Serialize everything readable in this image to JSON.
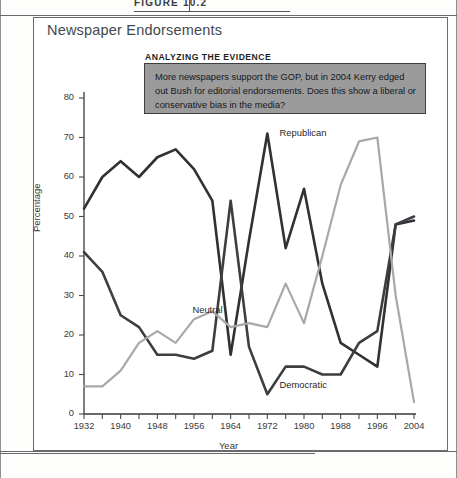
{
  "figure": {
    "number_label": "FIGURE 10.2",
    "title": "Newspaper Endorsements"
  },
  "callout": {
    "heading": "ANALYZING THE EVIDENCE",
    "body": "More newspapers support the GOP, but in 2004 Kerry edged out Bush for editorial endorsements. Does this show a liberal or conservative bias in the media?",
    "background_color": "#9b9b9b",
    "border_color": "#3f3f3f"
  },
  "chart_data": {
    "type": "line",
    "title": "Newspaper Endorsements",
    "xlabel": "Year",
    "ylabel": "Percentage",
    "ylim": [
      0,
      80
    ],
    "xlim": [
      1932,
      2004
    ],
    "grid": false,
    "legend_position": "inline-labels",
    "ytick_labels": [
      "0",
      "10",
      "20",
      "30",
      "40",
      "50",
      "60",
      "70",
      "80"
    ],
    "ytick_values": [
      0,
      10,
      20,
      30,
      40,
      50,
      60,
      70,
      80
    ],
    "xtick_labels": [
      "1932",
      "1940",
      "1948",
      "1956",
      "1964",
      "1972",
      "1980",
      "1988",
      "1996",
      "2004"
    ],
    "xtick_values": [
      1932,
      1940,
      1948,
      1956,
      1964,
      1972,
      1980,
      1988,
      1996,
      2004
    ],
    "x": [
      1932,
      1936,
      1940,
      1944,
      1948,
      1952,
      1956,
      1960,
      1964,
      1968,
      1972,
      1976,
      1980,
      1984,
      1988,
      1992,
      1996,
      2000,
      2004
    ],
    "series": [
      {
        "name": "Republican",
        "color": "#2f3134",
        "values": [
          52,
          60,
          64,
          60,
          65,
          67,
          62,
          54,
          15,
          44,
          71,
          42,
          57,
          33,
          18,
          15,
          12,
          48,
          49
        ]
      },
      {
        "name": "Democratic",
        "color": "#3c3e41",
        "values": [
          41,
          36,
          25,
          22,
          15,
          15,
          14,
          16,
          54,
          17,
          5,
          12,
          12,
          10,
          10,
          18,
          21,
          48,
          50
        ]
      },
      {
        "name": "Neutral",
        "color": "#a8a8a8",
        "values": [
          7,
          7,
          11,
          18,
          21,
          18,
          24,
          26,
          22,
          23,
          22,
          33,
          23,
          40,
          58,
          69,
          70,
          30,
          3
        ]
      }
    ],
    "annotations": [
      {
        "text": "Republican",
        "x": 1974,
        "y": 71
      },
      {
        "text": "Democratic",
        "x": 1974,
        "y": 7
      },
      {
        "text": "Neutral",
        "x": 1955,
        "y": 26
      }
    ]
  }
}
